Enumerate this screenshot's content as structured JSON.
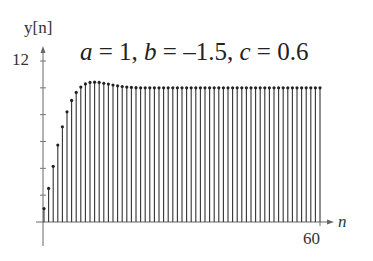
{
  "chart_data": {
    "type": "stem",
    "title_parts": {
      "a_label": "a",
      "a_val": "1",
      "b_label": "b",
      "b_val": "–1.5",
      "c_label": "c",
      "c_val": "0.6"
    },
    "xlabel": "n",
    "ylabel": "y[n]",
    "x_tick_labels": [
      "60"
    ],
    "y_tick_labels": [
      "12"
    ],
    "xlim": [
      0,
      60
    ],
    "ylim": [
      0,
      12
    ],
    "y_minor_ticks": [
      2,
      4,
      6,
      8,
      10,
      12
    ],
    "x": [
      0,
      1,
      2,
      3,
      4,
      5,
      6,
      7,
      8,
      9,
      10,
      11,
      12,
      13,
      14,
      15,
      16,
      17,
      18,
      19,
      20,
      21,
      22,
      23,
      24,
      25,
      26,
      27,
      28,
      29,
      30,
      31,
      32,
      33,
      34,
      35,
      36,
      37,
      38,
      39,
      40,
      41,
      42,
      43,
      44,
      45,
      46,
      47,
      48,
      49,
      50,
      51,
      52,
      53,
      54,
      55,
      56,
      57,
      58,
      59,
      60
    ],
    "values": [
      1.0,
      2.5,
      4.15,
      5.73,
      7.1,
      8.21,
      9.06,
      9.66,
      10.06,
      10.29,
      10.4,
      10.42,
      10.4,
      10.34,
      10.28,
      10.21,
      10.15,
      10.1,
      10.06,
      10.03,
      10.01,
      10.0,
      10.0,
      10.0,
      10.0,
      10.0,
      10.0,
      10.0,
      10.0,
      10.0,
      10.0,
      10.0,
      10.0,
      10.0,
      10.0,
      10.0,
      10.0,
      10.0,
      10.0,
      10.0,
      10.0,
      10.0,
      10.0,
      10.0,
      10.0,
      10.0,
      10.0,
      10.0,
      10.0,
      10.0,
      10.0,
      10.0,
      10.0,
      10.0,
      10.0,
      10.0,
      10.0,
      10.0,
      10.0,
      10.0,
      10.0
    ],
    "grid": false,
    "legend": null
  }
}
